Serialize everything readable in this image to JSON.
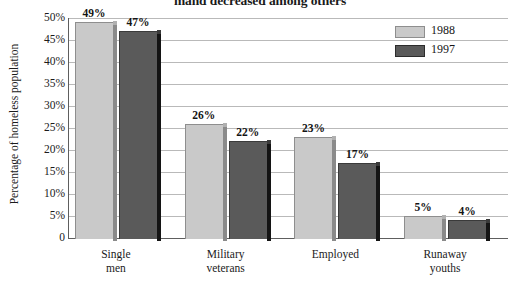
{
  "chart_data": {
    "type": "bar",
    "title": "mand decreased among others",
    "xlabel": "",
    "ylabel": "Percentage of homeless population",
    "ylim": [
      0,
      50
    ],
    "grid": true,
    "legend_position": "top-right",
    "categories": [
      "Single men",
      "Military veterans",
      "Employed",
      "Runaway youths"
    ],
    "category_lines": [
      [
        "Single",
        "men"
      ],
      [
        "Military",
        "veterans"
      ],
      [
        "Employed",
        ""
      ],
      [
        "Runaway",
        "youths"
      ]
    ],
    "y_ticks": [
      "0",
      "5%",
      "10%",
      "15%",
      "20%",
      "25%",
      "30%",
      "35%",
      "40%",
      "45%",
      "50%"
    ],
    "y_tick_values": [
      0,
      5,
      10,
      15,
      20,
      25,
      30,
      35,
      40,
      45,
      50
    ],
    "series": [
      {
        "name": "1988",
        "color": "#c9c9c9",
        "values": [
          49,
          26,
          23,
          5
        ],
        "labels": [
          "49%",
          "26%",
          "23%",
          "5%"
        ]
      },
      {
        "name": "1997",
        "color": "#5a5a5a",
        "values": [
          47,
          22,
          17,
          4
        ],
        "labels": [
          "47%",
          "22%",
          "17%",
          "4%"
        ]
      }
    ]
  },
  "legend": {
    "items": [
      {
        "label": "1988",
        "color": "#c9c9c9"
      },
      {
        "label": "1997",
        "color": "#5a5a5a"
      }
    ]
  },
  "axis": {
    "y_title": "Percentage of homeless population"
  },
  "colors": {
    "series_1988": "#c9c9c9",
    "series_1997": "#5a5a5a",
    "gridline": "#b9b9b9",
    "axis": "#5e5e5e",
    "text": "#1b1b1b",
    "background": "#ffffff"
  }
}
